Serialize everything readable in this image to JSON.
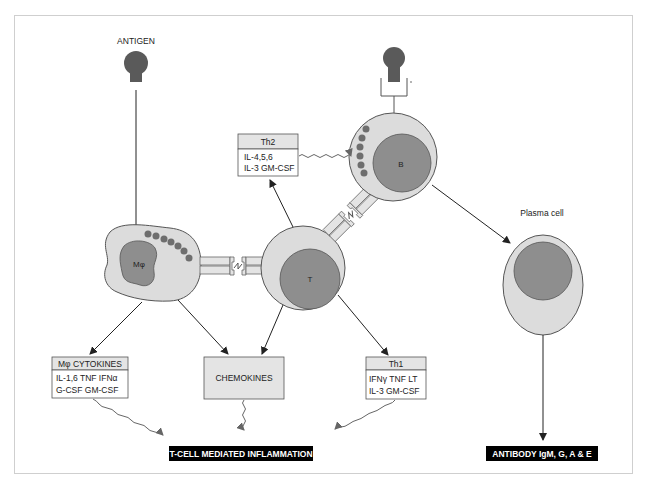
{
  "labels": {
    "antigen": "ANTIGEN",
    "plasma_cell": "Plasma cell",
    "macrophage": "Mφ",
    "t_cell": "T",
    "b_cell": "B"
  },
  "boxes": {
    "th2": {
      "title": "Th2",
      "line1": "IL-4,5,6",
      "line2": "IL-3 GM-CSF"
    },
    "mo_cytokines": {
      "title": "Mφ CYTOKINES",
      "line1": "IL-1,6  TNF  IFNα",
      "line2": "G-CSF GM-CSF"
    },
    "chemokines": {
      "title": "CHEMOKINES"
    },
    "th1": {
      "title": "Th1",
      "line1": "IFNγ TNF  LT",
      "line2": "IL-3 GM-CSF"
    }
  },
  "outputs": {
    "inflammation": "T-CELL MEDIATED INFLAMMATION",
    "antibody": "ANTIBODY IgM, G, A & E"
  },
  "colors": {
    "cell_fill": "#dcdcdc",
    "nucleus_fill": "#8e8e8e",
    "granule": "#6e6e6e",
    "antigen": "#5a5a5a",
    "outline": "#555555",
    "output_bg": "#000000",
    "frame": "#cfcfcf"
  }
}
